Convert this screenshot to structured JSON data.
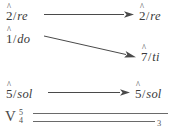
{
  "figure": {
    "type": "voice-leading-diagram",
    "background_color": "#ffffff",
    "ink_color": "#4a4a4a",
    "rows": [
      {
        "id": "row-re",
        "source": {
          "degree": "2",
          "hat": "^",
          "separator": "/",
          "syllable": "re",
          "text": "2̂/re"
        },
        "target": {
          "degree": "2",
          "hat": "^",
          "separator": "/",
          "syllable": "re",
          "text": "2̂/re"
        },
        "connector": "horizontal-arrow"
      },
      {
        "id": "row-do-ti",
        "source": {
          "degree": "1",
          "hat": "^",
          "separator": "/",
          "syllable": "do",
          "text": "1̂/do"
        },
        "target": {
          "degree": "7",
          "hat": "^",
          "separator": "/",
          "syllable": "ti",
          "text": "7̂/ti"
        },
        "connector": "diagonal-arrow"
      },
      {
        "id": "row-sol",
        "source": {
          "degree": "5",
          "hat": "^",
          "separator": "/",
          "syllable": "sol",
          "text": "5̂/sol"
        },
        "target": {
          "degree": "5",
          "hat": "^",
          "separator": "/",
          "syllable": "sol",
          "text": "5̂/sol"
        },
        "connector": "horizontal-arrow"
      }
    ],
    "harmony": {
      "id": "row-chord",
      "roman_numeral": "V",
      "figured_bass_upper": "5",
      "figured_bass_lower": "4",
      "resolution_figure": "3",
      "connector": "double-hold-line"
    }
  }
}
